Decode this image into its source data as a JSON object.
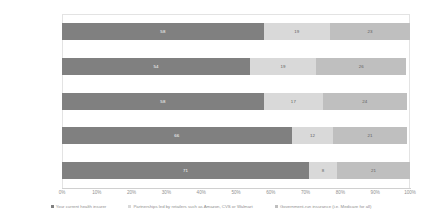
{
  "chart_data": {
    "type": "bar",
    "orientation": "horizontal",
    "stacked": true,
    "stack_mode": "percent",
    "title": "",
    "subtitle": "",
    "xlabel": "",
    "ylabel": "",
    "xlim": [
      0,
      100
    ],
    "xticks": [
      "0%",
      "10%",
      "20%",
      "30%",
      "40%",
      "50%",
      "60%",
      "70%",
      "80%",
      "90%",
      "100%"
    ],
    "xtick_values": [
      0,
      10,
      20,
      30,
      40,
      50,
      60,
      70,
      80,
      90,
      100
    ],
    "grid": false,
    "legend_position": "bottom",
    "categories": [
      "Total",
      "Millennial",
      "Generation X",
      "Baby Boomers",
      "Silent Generation"
    ],
    "series": [
      {
        "name": "Your current health insurer",
        "color": "#808080",
        "values": [
          58,
          54,
          58,
          66,
          71
        ]
      },
      {
        "name": "Partnerships led by retailers such as Amazon, CVS or Walmart",
        "color": "#d9d9d9",
        "values": [
          19,
          19,
          17,
          12,
          8
        ]
      },
      {
        "name": "Government-run insurance (i.e. Medicare for all)",
        "color": "#bfbfbf",
        "values": [
          23,
          26,
          24,
          21,
          21
        ]
      }
    ],
    "data_labels": [
      [
        "58",
        "19",
        "23"
      ],
      [
        "54",
        "19",
        "26"
      ],
      [
        "58",
        "17",
        "24"
      ],
      [
        "66",
        "12",
        "21"
      ],
      [
        "71",
        "8",
        "21"
      ]
    ]
  },
  "legend": {
    "items": [
      {
        "label": "Your current health insurer",
        "color": "#808080"
      },
      {
        "label": "Partnerships led by retailers such as Amazon, CVS or Walmart",
        "color": "#d9d9d9"
      },
      {
        "label": "Government-run insurance (i.e. Medicare for all)",
        "color": "#bfbfbf"
      }
    ]
  }
}
